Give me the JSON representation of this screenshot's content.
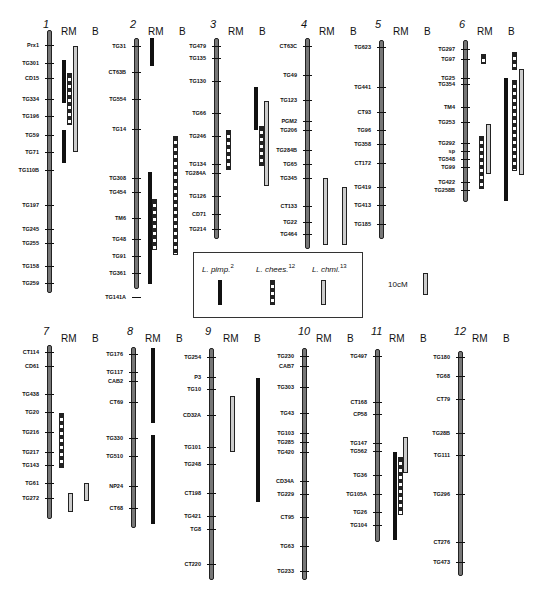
{
  "figure": {
    "column_headers": {
      "rm": "RM",
      "b": "B"
    },
    "legend": {
      "items": [
        {
          "label": "L. pimp.",
          "sup": "2",
          "style": "solid-black"
        },
        {
          "label": "L. chees.",
          "sup": "12",
          "style": "dashed-hatched"
        },
        {
          "label": "L. chmi.",
          "sup": "13",
          "style": "open-gray"
        }
      ],
      "scale_label": "10cM"
    }
  },
  "chromosomes": [
    {
      "num": "1",
      "markers": [
        "Prx1",
        "TG301",
        "CD15",
        "TG334",
        "TG196",
        "TG59",
        "TG71",
        "TG110B",
        "TG197",
        "TG245",
        "TG255",
        "TG158",
        "TG259"
      ]
    },
    {
      "num": "2",
      "markers": [
        "TG31",
        "CT63B",
        "TG554",
        "TG14",
        "TG308",
        "TG454",
        "TM6",
        "TG48",
        "TG91",
        "TG361",
        "TG141A"
      ]
    },
    {
      "num": "3",
      "markers": [
        "TG479",
        "TG135",
        "TG130",
        "TG66",
        "TG246",
        "TG134",
        "TG284A",
        "TG126",
        "CD71",
        "TG214"
      ]
    },
    {
      "num": "4",
      "markers": [
        "CT63C",
        "TG49",
        "TG123",
        "PGM2",
        "TG206",
        "TG284B",
        "TG65",
        "TG345",
        "CT133",
        "TG22",
        "TG464"
      ]
    },
    {
      "num": "5",
      "markers": [
        "TG623",
        "TG441",
        "CT93",
        "TG96",
        "TG358",
        "CT172",
        "TG419",
        "TG413",
        "TG185"
      ]
    },
    {
      "num": "6",
      "markers": [
        "TG297",
        "TG97",
        "TG25",
        "TG354",
        "TM4",
        "TG253",
        "TG292",
        "sp",
        "TG548",
        "TG99",
        "TG422",
        "TG258B"
      ]
    },
    {
      "num": "7",
      "markers": [
        "CT114",
        "CD61",
        "TG438",
        "TG20",
        "TG216",
        "TG217",
        "TG143",
        "TG61",
        "TG272"
      ]
    },
    {
      "num": "8",
      "markers": [
        "TG176",
        "TG117",
        "CAB2",
        "CT69",
        "TG330",
        "TG510",
        "NP24",
        "CT68"
      ]
    },
    {
      "num": "9",
      "markers": [
        "TG254",
        "P3",
        "TG10",
        "CD32A",
        "TG101",
        "TG248",
        "CT198",
        "TG421",
        "TG8",
        "CT220"
      ]
    },
    {
      "num": "10",
      "markers": [
        "TG230",
        "CAB7",
        "TG303",
        "TG43",
        "TG103",
        "TG285",
        "TG420",
        "CD34A",
        "TG229",
        "CT95",
        "TG63",
        "TG233"
      ]
    },
    {
      "num": "11",
      "markers": [
        "TG497",
        "CT168",
        "CP58",
        "TG147",
        "TG562",
        "TG36",
        "TG105A",
        "TG26",
        "TG104"
      ]
    },
    {
      "num": "12",
      "markers": [
        "TG180",
        "TG68",
        "CT79",
        "TG28B",
        "TG111",
        "TG296",
        "CT276",
        "TG473"
      ]
    }
  ]
}
